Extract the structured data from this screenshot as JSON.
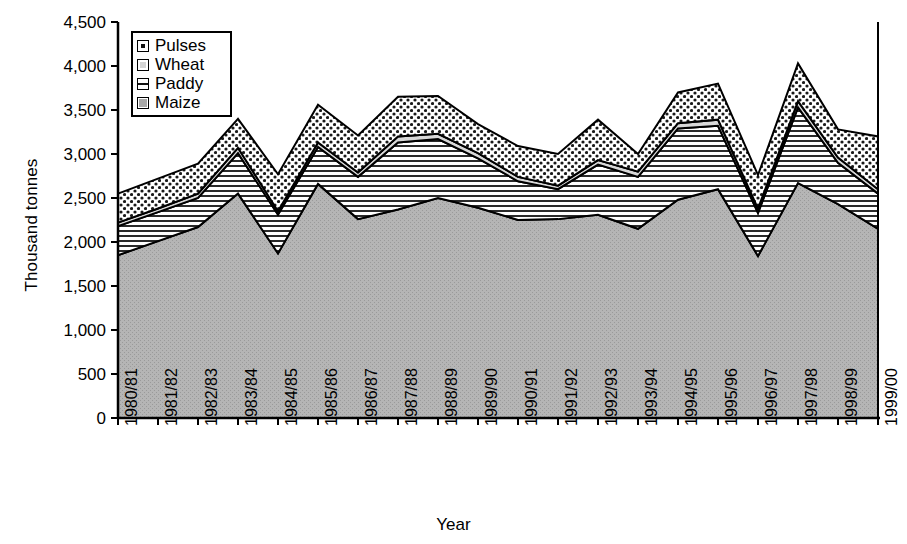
{
  "chart_data": {
    "type": "area",
    "stacked": true,
    "title": "",
    "xlabel": "Year",
    "ylabel": "Thousand tonnes",
    "ylim": [
      0,
      4500
    ],
    "ytick_step": 500,
    "yticks": [
      "0",
      "500",
      "1,000",
      "1,500",
      "2,000",
      "2,500",
      "3,000",
      "3,500",
      "4,000",
      "4,500"
    ],
    "grid": false,
    "legend_position": "top-left",
    "categories": [
      "1980/81",
      "1981/82",
      "1982/83",
      "1983/84",
      "1984/85",
      "1985/86",
      "1986/87",
      "1987/88",
      "1988/89",
      "1989/90",
      "1990/91",
      "1991/92",
      "1992/93",
      "1993/94",
      "1994/95",
      "1995/96",
      "1996/97",
      "1997/98",
      "1998/99",
      "1999/00"
    ],
    "series": [
      {
        "name": "Maize",
        "fill": "solid-gray",
        "color": "#b3b3b3",
        "values": [
          1850,
          2010,
          2170,
          2550,
          1870,
          2660,
          2260,
          2370,
          2500,
          2390,
          2250,
          2260,
          2310,
          2150,
          2480,
          2600,
          1840,
          2670,
          2430,
          2150
        ]
      },
      {
        "name": "Paddy",
        "fill": "horizontal-lines",
        "color": "#e8e8e8",
        "values": [
          330,
          330,
          330,
          460,
          440,
          420,
          480,
          760,
          670,
          560,
          440,
          340,
          570,
          590,
          810,
          720,
          490,
          860,
          470,
          400
        ]
      },
      {
        "name": "Wheat",
        "fill": "light-gray",
        "color": "#cfcfcf",
        "values": [
          40,
          40,
          50,
          60,
          40,
          50,
          50,
          70,
          60,
          60,
          50,
          40,
          50,
          60,
          60,
          70,
          50,
          70,
          60,
          50
        ]
      },
      {
        "name": "Pulses",
        "fill": "dotted",
        "color": "#ffffff",
        "values": [
          330,
          340,
          340,
          330,
          420,
          430,
          420,
          450,
          430,
          330,
          350,
          360,
          460,
          200,
          350,
          410,
          380,
          430,
          320,
          600
        ]
      }
    ],
    "totals": [
      2550,
      2720,
      2890,
      3400,
      2770,
      3560,
      3210,
      3650,
      3660,
      3340,
      3090,
      3000,
      3390,
      3000,
      3700,
      3800,
      2760,
      4030,
      3280,
      3200
    ]
  },
  "legend": {
    "items": [
      {
        "label": "Pulses",
        "swatch": "dotted-swatch"
      },
      {
        "label": "Wheat",
        "swatch": "light-gray-swatch"
      },
      {
        "label": "Paddy",
        "swatch": "horizontal-lines-swatch"
      },
      {
        "label": "Maize",
        "swatch": "solid-gray-swatch"
      }
    ]
  },
  "axes": {
    "y_title": "Thousand tonnes",
    "x_title": "Year"
  }
}
